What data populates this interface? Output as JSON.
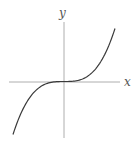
{
  "figure": {
    "x_label": "x",
    "y_label": "y",
    "colors": {
      "axis": "#9a9a9a",
      "curve": "#3a3a3a",
      "label": "#555555",
      "background": "#ffffff"
    }
  },
  "chart_data": {
    "type": "line",
    "title": "",
    "xlabel": "x",
    "ylabel": "y",
    "function": "y = x^3",
    "grid": false,
    "ticks": false,
    "series": [
      {
        "name": "cubic",
        "x": [
          -1.0,
          -0.75,
          -0.5,
          -0.25,
          0,
          0.25,
          0.5,
          0.75,
          1.0
        ],
        "values": [
          -1.0,
          -0.42,
          -0.125,
          -0.016,
          0,
          0.016,
          0.125,
          0.42,
          1.0
        ]
      }
    ]
  }
}
